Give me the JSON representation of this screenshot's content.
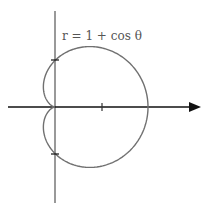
{
  "diagram": {
    "equation_label": "r = 1 + cos θ",
    "curve": "cardioid",
    "origin_px": [
      55,
      107
    ],
    "unit_px": 46.5,
    "colors": {
      "curve": "#707070",
      "axis": "#222222",
      "label": "#555555",
      "background": "#ffffff"
    },
    "ticks": {
      "x_axis": [
        1
      ],
      "y_axis": [
        1,
        -1
      ]
    },
    "icons": [
      "arrow-right-icon"
    ]
  }
}
